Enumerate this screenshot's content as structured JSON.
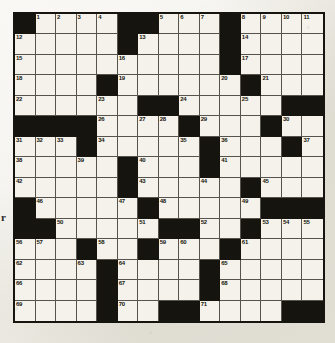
{
  "page": {
    "background_color": "#eceae2",
    "margin_text": "r"
  },
  "puzzle": {
    "type": "crossword-grid",
    "rows": 15,
    "columns": 15,
    "cell_color": "#f4f2ea",
    "block_color": "#15140f",
    "number_color": "#17160f",
    "highest_clue_number": 71,
    "black_cells": [
      [
        0,
        0
      ],
      [
        0,
        5
      ],
      [
        0,
        6
      ],
      [
        0,
        10
      ],
      [
        1,
        5
      ],
      [
        1,
        10
      ],
      [
        2,
        10
      ],
      [
        3,
        4
      ],
      [
        3,
        11
      ],
      [
        4,
        6
      ],
      [
        4,
        7
      ],
      [
        4,
        13
      ],
      [
        4,
        14
      ],
      [
        5,
        0
      ],
      [
        5,
        1
      ],
      [
        5,
        2
      ],
      [
        5,
        3
      ],
      [
        5,
        8
      ],
      [
        5,
        12
      ],
      [
        6,
        3
      ],
      [
        6,
        9
      ],
      [
        6,
        13
      ],
      [
        7,
        5
      ],
      [
        7,
        9
      ],
      [
        8,
        5
      ],
      [
        8,
        11
      ],
      [
        9,
        0
      ],
      [
        9,
        6
      ],
      [
        9,
        12
      ],
      [
        9,
        13
      ],
      [
        9,
        14
      ],
      [
        10,
        0
      ],
      [
        10,
        1
      ],
      [
        10,
        7
      ],
      [
        10,
        8
      ],
      [
        10,
        11
      ],
      [
        11,
        3
      ],
      [
        11,
        6
      ],
      [
        11,
        10
      ],
      [
        12,
        4
      ],
      [
        12,
        9
      ],
      [
        13,
        4
      ],
      [
        13,
        9
      ],
      [
        14,
        4
      ],
      [
        14,
        7
      ],
      [
        14,
        8
      ],
      [
        14,
        13
      ],
      [
        14,
        14
      ]
    ],
    "numbers": [
      {
        "row": 0,
        "col": 1,
        "n": 1
      },
      {
        "row": 0,
        "col": 2,
        "n": 2
      },
      {
        "row": 0,
        "col": 3,
        "n": 3
      },
      {
        "row": 0,
        "col": 4,
        "n": 4
      },
      {
        "row": 0,
        "col": 7,
        "n": 5
      },
      {
        "row": 0,
        "col": 8,
        "n": 6
      },
      {
        "row": 0,
        "col": 9,
        "n": 7
      },
      {
        "row": 0,
        "col": 11,
        "n": 8
      },
      {
        "row": 0,
        "col": 12,
        "n": 9
      },
      {
        "row": 0,
        "col": 13,
        "n": 10
      },
      {
        "row": 0,
        "col": 14,
        "n": 11
      },
      {
        "row": 1,
        "col": 0,
        "n": 12
      },
      {
        "row": 1,
        "col": 6,
        "n": 13
      },
      {
        "row": 1,
        "col": 11,
        "n": 14
      },
      {
        "row": 2,
        "col": 0,
        "n": 15
      },
      {
        "row": 2,
        "col": 5,
        "n": 16
      },
      {
        "row": 2,
        "col": 11,
        "n": 17
      },
      {
        "row": 3,
        "col": 0,
        "n": 18
      },
      {
        "row": 3,
        "col": 5,
        "n": 19
      },
      {
        "row": 3,
        "col": 10,
        "n": 20
      },
      {
        "row": 3,
        "col": 12,
        "n": 21
      },
      {
        "row": 4,
        "col": 0,
        "n": 22
      },
      {
        "row": 4,
        "col": 4,
        "n": 23
      },
      {
        "row": 4,
        "col": 8,
        "n": 24
      },
      {
        "row": 4,
        "col": 11,
        "n": 25
      },
      {
        "row": 5,
        "col": 4,
        "n": 26
      },
      {
        "row": 5,
        "col": 6,
        "n": 27
      },
      {
        "row": 5,
        "col": 7,
        "n": 28
      },
      {
        "row": 5,
        "col": 9,
        "n": 29
      },
      {
        "row": 5,
        "col": 13,
        "n": 30
      },
      {
        "row": 6,
        "col": 0,
        "n": 31
      },
      {
        "row": 6,
        "col": 1,
        "n": 32
      },
      {
        "row": 6,
        "col": 2,
        "n": 33
      },
      {
        "row": 6,
        "col": 4,
        "n": 34
      },
      {
        "row": 6,
        "col": 8,
        "n": 35
      },
      {
        "row": 6,
        "col": 10,
        "n": 36
      },
      {
        "row": 6,
        "col": 14,
        "n": 37
      },
      {
        "row": 7,
        "col": 0,
        "n": 38
      },
      {
        "row": 7,
        "col": 3,
        "n": 39
      },
      {
        "row": 7,
        "col": 6,
        "n": 40
      },
      {
        "row": 7,
        "col": 10,
        "n": 41
      },
      {
        "row": 8,
        "col": 0,
        "n": 42
      },
      {
        "row": 8,
        "col": 6,
        "n": 43
      },
      {
        "row": 8,
        "col": 9,
        "n": 44
      },
      {
        "row": 8,
        "col": 12,
        "n": 45
      },
      {
        "row": 9,
        "col": 1,
        "n": 46
      },
      {
        "row": 9,
        "col": 5,
        "n": 47
      },
      {
        "row": 9,
        "col": 7,
        "n": 48
      },
      {
        "row": 9,
        "col": 11,
        "n": 49
      },
      {
        "row": 10,
        "col": 2,
        "n": 50
      },
      {
        "row": 10,
        "col": 6,
        "n": 51
      },
      {
        "row": 10,
        "col": 9,
        "n": 52
      },
      {
        "row": 10,
        "col": 12,
        "n": 53
      },
      {
        "row": 10,
        "col": 13,
        "n": 54
      },
      {
        "row": 10,
        "col": 14,
        "n": 55
      },
      {
        "row": 11,
        "col": 0,
        "n": 56
      },
      {
        "row": 11,
        "col": 1,
        "n": 57
      },
      {
        "row": 11,
        "col": 4,
        "n": 58
      },
      {
        "row": 11,
        "col": 7,
        "n": 59
      },
      {
        "row": 11,
        "col": 8,
        "n": 60
      },
      {
        "row": 11,
        "col": 11,
        "n": 61
      },
      {
        "row": 12,
        "col": 0,
        "n": 62
      },
      {
        "row": 12,
        "col": 3,
        "n": 63
      },
      {
        "row": 12,
        "col": 5,
        "n": 64
      },
      {
        "row": 12,
        "col": 10,
        "n": 65
      },
      {
        "row": 13,
        "col": 0,
        "n": 66
      },
      {
        "row": 13,
        "col": 5,
        "n": 67
      },
      {
        "row": 13,
        "col": 10,
        "n": 68
      },
      {
        "row": 14,
        "col": 0,
        "n": 69
      },
      {
        "row": 14,
        "col": 5,
        "n": 70
      },
      {
        "row": 14,
        "col": 9,
        "n": 71
      }
    ],
    "letters": []
  }
}
